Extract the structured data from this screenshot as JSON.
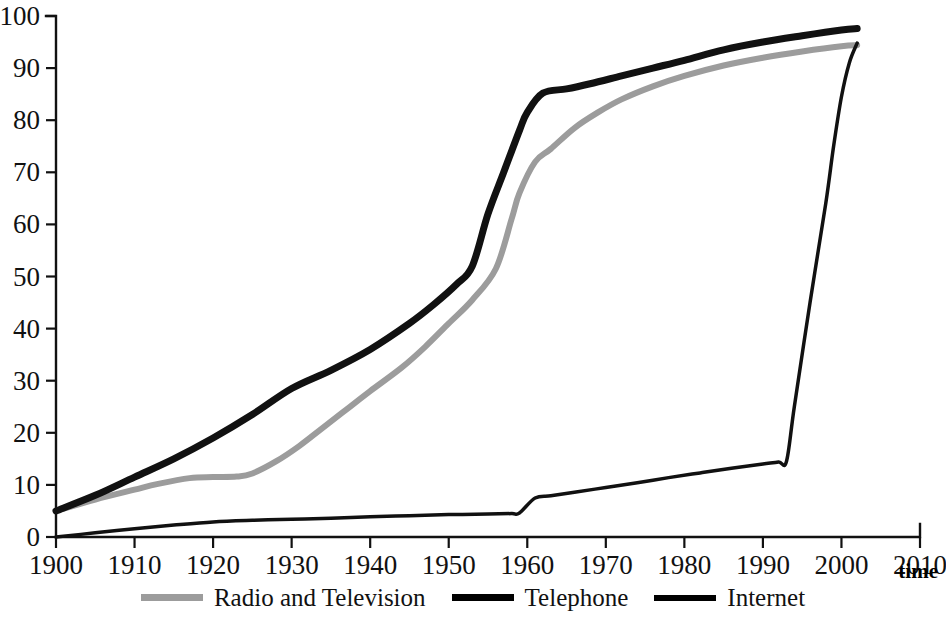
{
  "chart_data": {
    "type": "line",
    "title": "",
    "xlabel": "time",
    "ylabel": "",
    "xlim": [
      1900,
      2010
    ],
    "ylim": [
      0,
      100
    ],
    "grid": false,
    "legend_position": "bottom",
    "x_ticks": [
      "1900",
      "1910",
      "1920",
      "1930",
      "1940",
      "1950",
      "1960",
      "1970",
      "1980",
      "1990",
      "2000",
      "2010"
    ],
    "y_ticks": [
      "0",
      "10",
      "20",
      "30",
      "40",
      "50",
      "60",
      "70",
      "80",
      "90",
      "100"
    ],
    "series": [
      {
        "name": "Radio and Television",
        "color": "#9c9c9c",
        "width": 6,
        "x": [
          1900,
          1905,
          1910,
          1913,
          1917,
          1920,
          1923,
          1925,
          1928,
          1931,
          1934,
          1937,
          1940,
          1944,
          1947,
          1950,
          1953,
          1956,
          1958,
          1959,
          1961,
          1963,
          1966,
          1969,
          1972,
          1976,
          1980,
          1985,
          1990,
          1995,
          2000,
          2002
        ],
        "values": [
          5.0,
          7.2,
          9.1,
          10.2,
          11.3,
          11.5,
          11.6,
          12.2,
          14.5,
          17.5,
          21.0,
          24.5,
          28.0,
          32.5,
          36.5,
          41.0,
          45.5,
          51.5,
          61.0,
          66.0,
          72.0,
          74.5,
          78.5,
          81.5,
          84.0,
          86.5,
          88.5,
          90.5,
          92.0,
          93.2,
          94.2,
          94.4
        ]
      },
      {
        "name": "Telephone",
        "color": "#111111",
        "width": 7,
        "x": [
          1900,
          1905,
          1910,
          1915,
          1920,
          1925,
          1930,
          1935,
          1940,
          1945,
          1948,
          1951,
          1953,
          1955,
          1957,
          1959,
          1960,
          1962,
          1965,
          1968,
          1972,
          1976,
          1980,
          1985,
          1990,
          1995,
          2000,
          2002
        ],
        "values": [
          5.0,
          8.0,
          11.5,
          15.0,
          19.0,
          23.5,
          28.5,
          32.0,
          36.0,
          41.0,
          44.5,
          48.5,
          52.0,
          62.0,
          70.0,
          78.0,
          81.5,
          85.2,
          86.0,
          87.0,
          88.5,
          90.0,
          91.5,
          93.5,
          95.0,
          96.2,
          97.3,
          97.6
        ]
      },
      {
        "name": "Internet",
        "color": "#111111",
        "width": 3.5,
        "x": [
          1900,
          1905,
          1910,
          1915,
          1920,
          1925,
          1930,
          1935,
          1940,
          1945,
          1950,
          1955,
          1958,
          1959,
          1961,
          1963,
          1966,
          1970,
          1974,
          1978,
          1982,
          1986,
          1990,
          1992,
          1993,
          1994,
          1996,
          1998,
          1999,
          2000,
          2001,
          2002
        ],
        "values": [
          0.0,
          0.8,
          1.6,
          2.3,
          2.9,
          3.2,
          3.4,
          3.6,
          3.9,
          4.1,
          4.3,
          4.4,
          4.5,
          4.6,
          7.5,
          7.9,
          8.6,
          9.5,
          10.4,
          11.4,
          12.3,
          13.2,
          14.0,
          14.4,
          14.5,
          25.0,
          45.0,
          64.0,
          75.0,
          84.5,
          91.0,
          94.8
        ]
      }
    ]
  },
  "legend": {
    "entries": [
      {
        "label": "Radio and Television",
        "style": "gray"
      },
      {
        "label": "Telephone",
        "style": "black-thick"
      },
      {
        "label": "Internet",
        "style": "black-thin"
      }
    ]
  },
  "axes": {
    "x_axis_title": "time"
  }
}
